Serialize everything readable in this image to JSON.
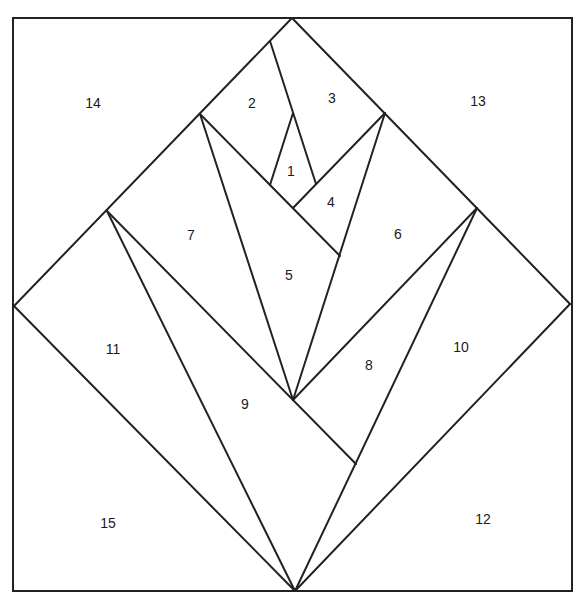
{
  "diagram": {
    "type": "paper-piecing-quilt-block",
    "frame": {
      "x": 13,
      "y": 18,
      "width": 559,
      "height": 573
    },
    "line_color": "#222222",
    "background": "#ffffff",
    "seams": [
      {
        "id": "diamond-top-left",
        "x1": 292,
        "y1": 18,
        "x2": 14,
        "y2": 306
      },
      {
        "id": "diamond-top-right",
        "x1": 292,
        "y1": 18,
        "x2": 570,
        "y2": 304
      },
      {
        "id": "diamond-bottom-left",
        "x1": 14,
        "y1": 306,
        "x2": 295,
        "y2": 591
      },
      {
        "id": "diamond-bottom-right",
        "x1": 570,
        "y1": 304,
        "x2": 295,
        "y2": 591
      },
      {
        "id": "seam-2-3",
        "x1": 270,
        "y1": 41,
        "x2": 316,
        "y2": 184
      },
      {
        "id": "seam-1-left",
        "x1": 293,
        "y1": 113,
        "x2": 270,
        "y2": 185
      },
      {
        "id": "seam-2-5",
        "x1": 200,
        "y1": 114,
        "x2": 340,
        "y2": 256
      },
      {
        "id": "seam-3-4",
        "x1": 385,
        "y1": 113,
        "x2": 293,
        "y2": 208
      },
      {
        "id": "seam-5-6",
        "x1": 385,
        "y1": 113,
        "x2": 293,
        "y2": 400
      },
      {
        "id": "seam-7-5",
        "x1": 200,
        "y1": 114,
        "x2": 293,
        "y2": 400
      },
      {
        "id": "seam-7-9",
        "x1": 107,
        "y1": 211,
        "x2": 356,
        "y2": 464
      },
      {
        "id": "seam-11-9",
        "x1": 107,
        "y1": 211,
        "x2": 295,
        "y2": 591
      },
      {
        "id": "seam-6-8",
        "x1": 477,
        "y1": 208,
        "x2": 293,
        "y2": 400
      },
      {
        "id": "seam-10-8",
        "x1": 477,
        "y1": 208,
        "x2": 295,
        "y2": 591
      }
    ],
    "labels": [
      {
        "text": "1",
        "x": 291,
        "y": 172
      },
      {
        "text": "2",
        "x": 252,
        "y": 104
      },
      {
        "text": "3",
        "x": 332,
        "y": 99
      },
      {
        "text": "4",
        "x": 331,
        "y": 203
      },
      {
        "text": "5",
        "x": 289,
        "y": 276
      },
      {
        "text": "6",
        "x": 398,
        "y": 235
      },
      {
        "text": "7",
        "x": 191,
        "y": 236
      },
      {
        "text": "8",
        "x": 369,
        "y": 366
      },
      {
        "text": "9",
        "x": 245,
        "y": 405
      },
      {
        "text": "10",
        "x": 461,
        "y": 348
      },
      {
        "text": "11",
        "x": 113,
        "y": 350
      },
      {
        "text": "12",
        "x": 483,
        "y": 520
      },
      {
        "text": "13",
        "x": 478,
        "y": 102
      },
      {
        "text": "14",
        "x": 93,
        "y": 104
      },
      {
        "text": "15",
        "x": 108,
        "y": 524
      }
    ]
  }
}
